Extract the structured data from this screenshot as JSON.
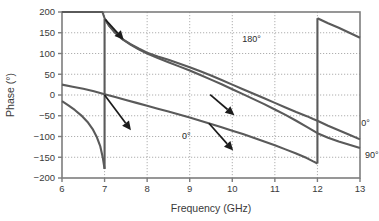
{
  "chart_data": {
    "type": "line",
    "title": "",
    "xlabel": "Frequency (GHz)",
    "ylabel": "Phase (°)",
    "xlim": [
      6,
      13
    ],
    "ylim": [
      -200,
      200
    ],
    "xticks": [
      "6",
      "7",
      "8",
      "9",
      "10",
      "11",
      "12",
      "13"
    ],
    "yticks": [
      "200",
      "150",
      "100",
      "50",
      "0",
      "−50",
      "−100",
      "−150",
      "−200"
    ],
    "xtick_values": [
      6,
      7,
      8,
      9,
      10,
      11,
      12,
      13
    ],
    "ytick_values": [
      200,
      150,
      100,
      50,
      0,
      -50,
      -100,
      -150,
      -200
    ],
    "grid": true,
    "grid_style": "dotted",
    "legend": "none",
    "line_color": "#5a5a5a",
    "axis_color": "#7d7d7d",
    "grid_color": "#9a9a9a",
    "annotation_color": "#1c1c1c",
    "series": [
      {
        "name": "180°",
        "points": [
          [
            6.0,
            375
          ],
          [
            6.2,
            350
          ],
          [
            6.4,
            322
          ],
          [
            6.6,
            291
          ],
          [
            6.8,
            252
          ],
          [
            6.95,
            205
          ],
          [
            7.0,
            185
          ],
          [
            7.0,
            185
          ],
          [
            7.1,
            168
          ],
          [
            7.25,
            150
          ],
          [
            7.4,
            136
          ],
          [
            7.6,
            123
          ],
          [
            7.8,
            112
          ],
          [
            8.0,
            102
          ],
          [
            8.25,
            93
          ],
          [
            8.5,
            85
          ],
          [
            8.75,
            76
          ],
          [
            9.0,
            67
          ],
          [
            9.25,
            57
          ],
          [
            9.5,
            47
          ],
          [
            9.75,
            36
          ],
          [
            10.0,
            25
          ],
          [
            10.25,
            14
          ],
          [
            10.5,
            3
          ],
          [
            10.75,
            -8
          ],
          [
            11.0,
            -19
          ],
          [
            11.25,
            -30
          ],
          [
            11.5,
            -41
          ],
          [
            11.75,
            -51
          ],
          [
            11.9,
            -58
          ],
          [
            12.0,
            -62
          ],
          [
            12.25,
            -74
          ],
          [
            12.5,
            -85
          ],
          [
            12.75,
            -96
          ],
          [
            13.0,
            -107
          ]
        ]
      },
      {
        "name": "0°",
        "points": [
          [
            6.0,
            25
          ],
          [
            6.25,
            20
          ],
          [
            6.5,
            15
          ],
          [
            6.75,
            9
          ],
          [
            7.0,
            2
          ],
          [
            7.25,
            -5
          ],
          [
            7.5,
            -12
          ],
          [
            7.75,
            -19
          ],
          [
            8.0,
            -26
          ],
          [
            8.25,
            -33
          ],
          [
            8.5,
            -40
          ],
          [
            8.75,
            -47
          ],
          [
            9.0,
            -54
          ],
          [
            9.25,
            -62
          ],
          [
            9.5,
            -70
          ],
          [
            9.75,
            -78
          ],
          [
            10.0,
            -86
          ],
          [
            10.25,
            -94
          ],
          [
            10.5,
            -103
          ],
          [
            10.75,
            -112
          ],
          [
            11.0,
            -121
          ],
          [
            11.25,
            -131
          ],
          [
            11.5,
            -141
          ],
          [
            11.75,
            -152
          ],
          [
            11.9,
            -160
          ],
          [
            12.0,
            -165
          ],
          [
            12.0,
            185
          ],
          [
            12.25,
            173
          ],
          [
            12.5,
            162
          ],
          [
            12.75,
            150
          ],
          [
            13.0,
            138
          ]
        ]
      },
      {
        "name": "90°",
        "points": [
          [
            6.0,
            -15
          ],
          [
            6.15,
            -25
          ],
          [
            6.3,
            -36
          ],
          [
            6.45,
            -49
          ],
          [
            6.6,
            -65
          ],
          [
            6.72,
            -82
          ],
          [
            6.82,
            -102
          ],
          [
            6.9,
            -124
          ],
          [
            6.96,
            -152
          ],
          [
            7.0,
            -178
          ],
          [
            7.0,
            183
          ],
          [
            7.1,
            168
          ],
          [
            7.25,
            150
          ],
          [
            7.4,
            136
          ],
          [
            7.6,
            122
          ],
          [
            7.8,
            110
          ],
          [
            8.0,
            100
          ],
          [
            8.25,
            89
          ],
          [
            8.5,
            79
          ],
          [
            8.75,
            69
          ],
          [
            9.0,
            59
          ],
          [
            9.25,
            48
          ],
          [
            9.5,
            37
          ],
          [
            9.75,
            26
          ],
          [
            10.0,
            14
          ],
          [
            10.25,
            2
          ],
          [
            10.5,
            -10
          ],
          [
            10.75,
            -22
          ],
          [
            11.0,
            -35
          ],
          [
            11.25,
            -48
          ],
          [
            11.5,
            -62
          ],
          [
            11.75,
            -77
          ],
          [
            11.9,
            -86
          ],
          [
            12.0,
            -92
          ],
          [
            12.25,
            -103
          ],
          [
            12.5,
            -112
          ],
          [
            12.75,
            -120
          ],
          [
            13.0,
            -128
          ]
        ]
      }
    ],
    "annotations": [
      {
        "label": "180°",
        "text_x": 10.45,
        "text_y": 127,
        "tail_x": 7.02,
        "tail_y": 182,
        "head_x": 7.45,
        "head_y": 133
      },
      {
        "label": "0°",
        "text_x": 8.92,
        "text_y": -107,
        "tail_x": 7.0,
        "tail_y": 0,
        "head_x": 7.62,
        "head_y": -85
      },
      {
        "label": "0°",
        "text_x": 13.13,
        "text_y": -74,
        "tail_x": 9.48,
        "tail_y": 1,
        "head_x": 10.05,
        "head_y": -49
      },
      {
        "label": "90°",
        "text_x": 13.28,
        "text_y": -151,
        "tail_x": 9.45,
        "tail_y": -68,
        "head_x": 10.02,
        "head_y": -134
      }
    ]
  },
  "axes": {
    "xlabel": "Frequency (GHz)",
    "ylabel": "Phase (°)"
  }
}
